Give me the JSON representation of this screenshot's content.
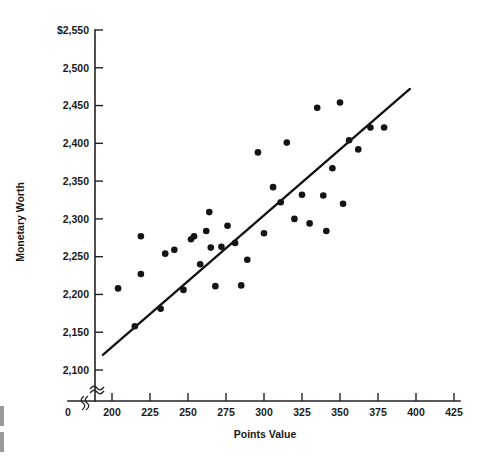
{
  "chart_data": {
    "type": "scatter",
    "title": "",
    "xlabel": "Points Value",
    "ylabel": "Monetary Worth",
    "xlim": [
      190,
      425
    ],
    "ylim": [
      2090,
      2550
    ],
    "grid": false,
    "legend": "none",
    "x_ticks": [
      200,
      225,
      250,
      275,
      300,
      325,
      350,
      375,
      400,
      425
    ],
    "x_tick_labels": [
      "200",
      "225",
      "250",
      "275",
      "300",
      "325",
      "350",
      "375",
      "400",
      "425"
    ],
    "x_origin_label": "0",
    "y_ticks": [
      2100,
      2150,
      2200,
      2250,
      2300,
      2350,
      2400,
      2450,
      2500,
      2550
    ],
    "y_tick_labels": [
      "2,100",
      "2,150",
      "2,200",
      "2,250",
      "2,300",
      "2,350",
      "2,400",
      "2,450",
      "2,500",
      "$2,550"
    ],
    "axis_break_x": true,
    "axis_break_y": true,
    "point_color": "#141414",
    "line_color": "#111111",
    "trendline": {
      "x_start": 194,
      "y_start": 2120,
      "x_end": 396,
      "y_end": 2472
    },
    "x": [
      204,
      215,
      219,
      219,
      232,
      235,
      241,
      247,
      252,
      254,
      258,
      262,
      264,
      265,
      268,
      272,
      276,
      281,
      285,
      289,
      296,
      300,
      306,
      311,
      315,
      320,
      325,
      330,
      335,
      339,
      341,
      345,
      350,
      352,
      356,
      362,
      370,
      379
    ],
    "y": [
      2208,
      2158,
      2277,
      2227,
      2181,
      2254,
      2259,
      2206,
      2273,
      2277,
      2240,
      2284,
      2309,
      2262,
      2211,
      2263,
      2291,
      2268,
      2212,
      2246,
      2388,
      2281,
      2342,
      2322,
      2401,
      2300,
      2332,
      2294,
      2447,
      2331,
      2284,
      2367,
      2454,
      2320,
      2404,
      2392,
      2421,
      2421
    ],
    "series_name": "observations",
    "n_points": 38
  }
}
